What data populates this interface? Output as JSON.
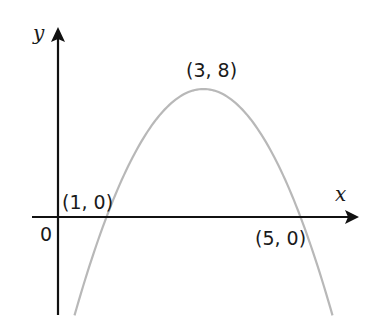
{
  "chart_data": {
    "type": "line",
    "title": "",
    "xlabel": "x",
    "ylabel": "y",
    "origin_label": "0",
    "equation": "y = -2(x - 3)^2 + 8",
    "curve_color": "#b8b8b8",
    "axis_color": "#111111",
    "grid": false,
    "xlim": [
      -0.2,
      6.3
    ],
    "ylim": [
      -6.2,
      11.9
    ],
    "points": [
      {
        "label": "(1, 0)",
        "x": 1,
        "y": 0,
        "role": "x-intercept"
      },
      {
        "label": "(3, 8)",
        "x": 3,
        "y": 8,
        "role": "vertex"
      },
      {
        "label": "(5, 0)",
        "x": 5,
        "y": 0,
        "role": "x-intercept"
      }
    ],
    "x": [
      0.34,
      0.5,
      1,
      1.5,
      2,
      2.5,
      3,
      3.5,
      4,
      4.5,
      5,
      5.5,
      5.66
    ],
    "series": [
      {
        "name": "parabola",
        "values": [
          -6.15,
          -4.5,
          0,
          3.5,
          6,
          7.5,
          8,
          7.5,
          6,
          3.5,
          0,
          -4.5,
          -6.15
        ]
      }
    ]
  },
  "labels": {
    "x_axis": "x",
    "y_axis": "y",
    "origin": "0",
    "vertex": "(3, 8)",
    "left_root": "(1, 0)",
    "right_root": "(5, 0)"
  }
}
